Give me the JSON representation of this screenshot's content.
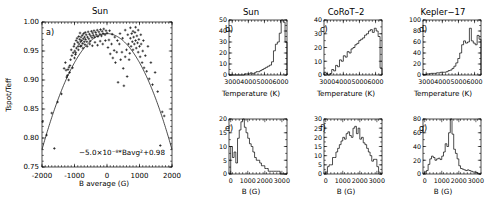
{
  "figure": {
    "panels": {
      "a": {
        "label": "a)",
        "title": "Sun",
        "xlabel": "B average (G)",
        "ylabel": "Tspot/Teff",
        "annotation": "−5.0×10⁻⁸*Bavg²+0.98",
        "xticks": [
          "-2000",
          "-1000",
          "0",
          "1000",
          "2000"
        ],
        "yticks": [
          "1.00",
          "0.95",
          "0.90",
          "0.85",
          "0.80",
          "0.75"
        ]
      },
      "b": {
        "label": "b)",
        "title": "Sun",
        "xlabel": "Temperature (K)",
        "xticks": [
          "3000",
          "4000",
          "5000",
          "6000"
        ],
        "yticks": [
          "0",
          "10",
          "20",
          "30",
          "40",
          "50"
        ]
      },
      "c": {
        "label": "c)",
        "title": "CoRoT–2",
        "xlabel": "Temperature (K)",
        "xticks": [
          "3000",
          "4000",
          "5000",
          "6000"
        ],
        "yticks": [
          "0",
          "10",
          "20",
          "30",
          "40"
        ]
      },
      "d": {
        "label": "d)",
        "title": "Kepler−17",
        "xlabel": "Temperature (K)",
        "xticks": [
          "3000",
          "4000",
          "5000",
          "6000"
        ],
        "yticks": [
          "0",
          "20",
          "40",
          "60",
          "80",
          "100"
        ]
      },
      "e": {
        "label": "e)",
        "title": "",
        "xlabel": "B (G)",
        "xticks": [
          "0",
          "1000",
          "2000",
          "3000"
        ],
        "yticks": [
          "0",
          "5",
          "10",
          "15",
          "20"
        ]
      },
      "f": {
        "label": "f)",
        "title": "",
        "xlabel": "B (G)",
        "xticks": [
          "0",
          "1000",
          "2000",
          "3000"
        ],
        "yticks": [
          "0",
          "5",
          "10",
          "15",
          "20",
          "25",
          "30"
        ]
      },
      "g": {
        "label": "g)",
        "title": "",
        "xlabel": "B (G)",
        "xticks": [
          "0",
          "1000",
          "2000",
          "3000"
        ],
        "yticks": [
          "0",
          "20",
          "40",
          "60",
          "80"
        ]
      }
    }
  },
  "chart_data": [
    {
      "id": "a",
      "type": "scatter",
      "title": "Sun",
      "xlabel": "B average (G)",
      "ylabel": "Tspot/Teff",
      "xlim": [
        -2000,
        2000
      ],
      "ylim": [
        0.75,
        1.0
      ],
      "grid": false,
      "annotation": "−5.0×10⁻⁸*Bavg²+0.98",
      "fit": {
        "type": "quadratic",
        "a": -5e-08,
        "b": 0.0,
        "c": 0.98
      },
      "points": [
        [
          -1980,
          0.828
        ],
        [
          -1860,
          0.805
        ],
        [
          -1700,
          0.843
        ],
        [
          -1620,
          0.782
        ],
        [
          -1520,
          0.862
        ],
        [
          -1400,
          0.876
        ],
        [
          -1320,
          0.92
        ],
        [
          -1280,
          0.93
        ],
        [
          -1240,
          0.905
        ],
        [
          -1200,
          0.918
        ],
        [
          -1170,
          0.922
        ],
        [
          -1150,
          0.913
        ],
        [
          -1120,
          0.935
        ],
        [
          -1100,
          0.952
        ],
        [
          -1080,
          0.942
        ],
        [
          -1060,
          0.921
        ],
        [
          -1040,
          0.947
        ],
        [
          -1020,
          0.958
        ],
        [
          -1000,
          0.962
        ],
        [
          -990,
          0.95
        ],
        [
          -970,
          0.944
        ],
        [
          -950,
          0.968
        ],
        [
          -940,
          0.955
        ],
        [
          -920,
          0.972
        ],
        [
          -900,
          0.965
        ],
        [
          -890,
          0.958
        ],
        [
          -870,
          0.975
        ],
        [
          -860,
          0.962
        ],
        [
          -840,
          0.97
        ],
        [
          -830,
          0.981
        ],
        [
          -810,
          0.966
        ],
        [
          -800,
          0.974
        ],
        [
          -790,
          0.959
        ],
        [
          -780,
          0.968
        ],
        [
          -760,
          0.977
        ],
        [
          -750,
          0.963
        ],
        [
          -730,
          0.971
        ],
        [
          -720,
          0.98
        ],
        [
          -700,
          0.966
        ],
        [
          -690,
          0.974
        ],
        [
          -670,
          0.982
        ],
        [
          -660,
          0.97
        ],
        [
          -640,
          0.978
        ],
        [
          -620,
          0.966
        ],
        [
          -600,
          0.974
        ],
        [
          -580,
          0.983
        ],
        [
          -560,
          0.971
        ],
        [
          -540,
          0.979
        ],
        [
          -520,
          0.967
        ],
        [
          -500,
          0.976
        ],
        [
          -480,
          0.984
        ],
        [
          -460,
          0.973
        ],
        [
          -440,
          0.981
        ],
        [
          -420,
          0.977
        ],
        [
          -400,
          0.985
        ],
        [
          -380,
          0.974
        ],
        [
          -350,
          0.982
        ],
        [
          -330,
          0.978
        ],
        [
          -300,
          0.986
        ],
        [
          -280,
          0.975
        ],
        [
          -250,
          0.983
        ],
        [
          -220,
          0.979
        ],
        [
          -200,
          0.987
        ],
        [
          -170,
          0.976
        ],
        [
          -150,
          0.984
        ],
        [
          -120,
          0.98
        ],
        [
          -100,
          0.988
        ],
        [
          -60,
          0.978
        ],
        [
          -30,
          0.985
        ],
        [
          0,
          0.981
        ],
        [
          30,
          0.956
        ],
        [
          60,
          0.969
        ],
        [
          100,
          0.945
        ],
        [
          140,
          0.962
        ],
        [
          180,
          0.938
        ],
        [
          220,
          0.951
        ],
        [
          260,
          0.93
        ],
        [
          300,
          0.948
        ],
        [
          340,
          0.896
        ],
        [
          380,
          0.962
        ],
        [
          420,
          0.935
        ],
        [
          460,
          0.948
        ],
        [
          500,
          0.92
        ],
        [
          520,
          0.89
        ],
        [
          560,
          0.94
        ],
        [
          600,
          0.952
        ],
        [
          620,
          0.906
        ],
        [
          660,
          0.962
        ],
        [
          680,
          0.935
        ],
        [
          700,
          0.946
        ],
        [
          720,
          0.972
        ],
        [
          740,
          0.958
        ],
        [
          760,
          0.98
        ],
        [
          780,
          0.966
        ],
        [
          800,
          0.952
        ],
        [
          820,
          0.974
        ],
        [
          840,
          0.962
        ],
        [
          860,
          0.982
        ],
        [
          880,
          0.968
        ],
        [
          900,
          0.955
        ],
        [
          920,
          0.976
        ],
        [
          940,
          0.964
        ],
        [
          960,
          0.948
        ],
        [
          980,
          0.97
        ],
        [
          1000,
          0.958
        ],
        [
          1020,
          0.94
        ],
        [
          1050,
          0.962
        ],
        [
          1080,
          0.93
        ],
        [
          1100,
          0.95
        ],
        [
          1140,
          0.921
        ],
        [
          1180,
          0.942
        ],
        [
          1220,
          0.915
        ],
        [
          1260,
          0.958
        ],
        [
          1300,
          0.902
        ],
        [
          1350,
          0.93
        ],
        [
          1400,
          0.892
        ],
        [
          1480,
          0.913
        ],
        [
          1560,
          0.88
        ],
        [
          1640,
          0.787
        ],
        [
          1700,
          0.845
        ],
        [
          1760,
          0.838
        ],
        [
          -1260,
          0.917
        ],
        [
          -1220,
          0.908
        ],
        [
          -1180,
          0.9
        ],
        [
          -1140,
          0.925
        ],
        [
          -1000,
          0.938
        ],
        [
          -960,
          0.947
        ],
        [
          -880,
          0.952
        ],
        [
          -820,
          0.958
        ],
        [
          -740,
          0.955
        ],
        [
          -680,
          0.961
        ],
        [
          -610,
          0.958
        ],
        [
          -530,
          0.962
        ],
        [
          -450,
          0.959
        ],
        [
          -370,
          0.965
        ],
        [
          -290,
          0.96
        ],
        [
          -210,
          0.967
        ],
        [
          -130,
          0.962
        ],
        [
          -50,
          0.968
        ],
        [
          80,
          0.985
        ],
        [
          160,
          0.979
        ],
        [
          240,
          0.974
        ],
        [
          320,
          0.968
        ],
        [
          400,
          0.98
        ],
        [
          480,
          0.972
        ],
        [
          560,
          0.986
        ],
        [
          640,
          0.978
        ],
        [
          720,
          0.99
        ],
        [
          800,
          0.984
        ],
        [
          880,
          0.991
        ],
        [
          960,
          0.986
        ],
        [
          1040,
          0.978
        ],
        [
          1120,
          0.968
        ]
      ]
    },
    {
      "id": "b",
      "type": "bar",
      "title": "Sun",
      "xlabel": "Temperature (K)",
      "ylabel": "",
      "xlim": [
        2800,
        6400
      ],
      "ylim": [
        0,
        50
      ],
      "bin_width": 120,
      "bin_start": 2800,
      "values": [
        0,
        0,
        0,
        0,
        0,
        0,
        0,
        0,
        1,
        1,
        1,
        2,
        1,
        2,
        3,
        3,
        4,
        5,
        6,
        7,
        8,
        9,
        12,
        22,
        28,
        30,
        38,
        50,
        48,
        30,
        8,
        1,
        0,
        0,
        0,
        0,
        0,
        0,
        0,
        0
      ]
    },
    {
      "id": "c",
      "type": "bar",
      "title": "CoRoT–2",
      "xlabel": "Temperature (K)",
      "ylabel": "",
      "xlim": [
        2800,
        6400
      ],
      "ylim": [
        0,
        40
      ],
      "bin_width": 120,
      "bin_start": 2800,
      "values": [
        2,
        1,
        0,
        1,
        4,
        3,
        7,
        6,
        11,
        10,
        14,
        13,
        17,
        16,
        19,
        20,
        22,
        23,
        25,
        26,
        27,
        29,
        30,
        32,
        33,
        31,
        34,
        32,
        28,
        5,
        1,
        0,
        0,
        0,
        0,
        0,
        0,
        0,
        0,
        0
      ]
    },
    {
      "id": "d",
      "type": "bar",
      "title": "Kepler−17",
      "xlabel": "Temperature (K)",
      "ylabel": "",
      "xlim": [
        2800,
        6400
      ],
      "ylim": [
        0,
        100
      ],
      "bin_width": 120,
      "bin_start": 2800,
      "values": [
        1,
        1,
        2,
        2,
        3,
        3,
        3,
        4,
        4,
        5,
        5,
        5,
        6,
        8,
        9,
        12,
        16,
        22,
        30,
        40,
        55,
        62,
        58,
        60,
        85,
        62,
        58,
        55,
        72,
        65,
        58,
        10,
        2,
        0,
        0,
        0,
        0,
        0,
        0,
        0
      ]
    },
    {
      "id": "e",
      "type": "bar",
      "title": "",
      "xlabel": "B (G)",
      "ylabel": "",
      "xlim": [
        -100,
        3300
      ],
      "ylim": [
        0,
        20
      ],
      "bin_width": 100,
      "bin_start": 0,
      "values": [
        10,
        6,
        8,
        4,
        13,
        16,
        19,
        20,
        17,
        15,
        13,
        11,
        10,
        8,
        6,
        5,
        5,
        4,
        3,
        3,
        2,
        2,
        1,
        1,
        1,
        1,
        1,
        1,
        1,
        0,
        0,
        0,
        0
      ]
    },
    {
      "id": "f",
      "type": "bar",
      "title": "",
      "xlabel": "B (G)",
      "ylabel": "",
      "xlim": [
        -100,
        3300
      ],
      "ylim": [
        0,
        30
      ],
      "bin_width": 100,
      "bin_start": 0,
      "values": [
        1,
        4,
        5,
        5,
        9,
        9,
        12,
        14,
        16,
        18,
        20,
        19,
        22,
        23,
        21,
        20,
        25,
        26,
        22,
        25,
        19,
        20,
        17,
        16,
        14,
        12,
        10,
        7,
        8,
        8,
        4,
        1,
        0
      ]
    },
    {
      "id": "g",
      "type": "bar",
      "title": "",
      "xlabel": "B (G)",
      "ylabel": "",
      "xlim": [
        -100,
        3300
      ],
      "ylim": [
        0,
        80
      ],
      "bin_width": 100,
      "bin_start": 0,
      "values": [
        3,
        5,
        14,
        22,
        26,
        24,
        20,
        22,
        23,
        21,
        26,
        32,
        44,
        40,
        60,
        80,
        58,
        36,
        30,
        22,
        12,
        8,
        7,
        6,
        5,
        6,
        5,
        4,
        3,
        3,
        2,
        1,
        0
      ]
    }
  ]
}
